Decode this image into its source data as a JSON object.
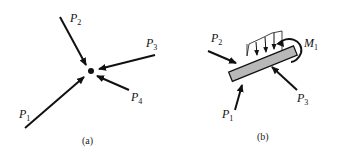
{
  "panel_a": {
    "caption": "(a)",
    "forces": [
      {
        "id": "P1",
        "label": "P",
        "sub": "1"
      },
      {
        "id": "P2",
        "label": "P",
        "sub": "2"
      },
      {
        "id": "P3",
        "label": "P",
        "sub": "3"
      },
      {
        "id": "P4",
        "label": "P",
        "sub": "4"
      }
    ],
    "description": "Concurrent forces acting on a particle"
  },
  "panel_b": {
    "caption": "(b)",
    "forces": [
      {
        "id": "P1",
        "label": "P",
        "sub": "1"
      },
      {
        "id": "P2",
        "label": "P",
        "sub": "2"
      },
      {
        "id": "P3",
        "label": "P",
        "sub": "3"
      }
    ],
    "moment": {
      "id": "M1",
      "label": "M",
      "sub": "1"
    },
    "description": "Forces, moment and distributed load acting on a rigid bar"
  },
  "colors": {
    "ink": "#111111",
    "bar_fill": "#b8b8b8"
  }
}
